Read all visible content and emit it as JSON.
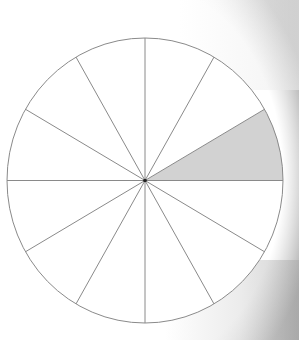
{
  "diagram": {
    "type": "fraction-circle",
    "total_sectors": 12,
    "shaded_sectors": 1,
    "shaded_sector_index": 0,
    "shaded_sector_start_angle_deg": 0,
    "shaded_sector_end_angle_deg": 30,
    "colors": {
      "outline": "#8a8a8a",
      "fill": "#ffffff",
      "shaded_fill": "#d2d2d2",
      "center_dot": "#222222"
    }
  }
}
